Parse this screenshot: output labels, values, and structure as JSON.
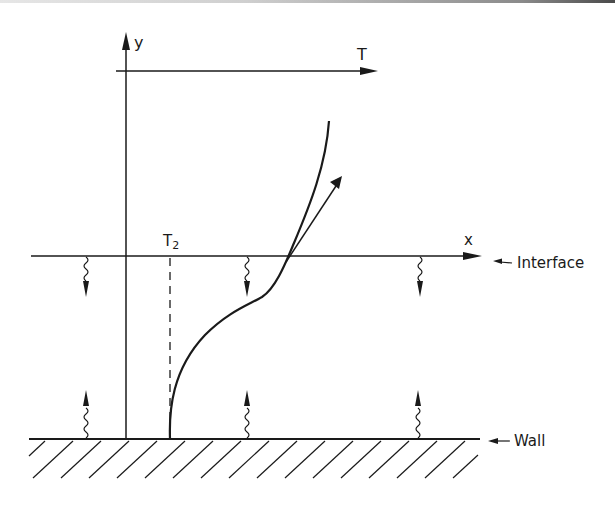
{
  "diagram": {
    "type": "temperature-profile-schematic",
    "labels": {
      "y_axis": "y",
      "t_axis": "T",
      "x_axis": "x",
      "t2": "T",
      "t2_sub": "2",
      "interface": "Interface",
      "wall": "Wall"
    },
    "colors": {
      "ink": "#1a1a1a",
      "background": "#ffffff"
    },
    "elements": {
      "heat_flux_down_at_interface": 3,
      "heat_flux_up_at_wall": 3,
      "has_tangent_arrow_at_interface": true,
      "has_dashed_reference_line_at_T2": true,
      "has_hatched_wall": true
    }
  }
}
